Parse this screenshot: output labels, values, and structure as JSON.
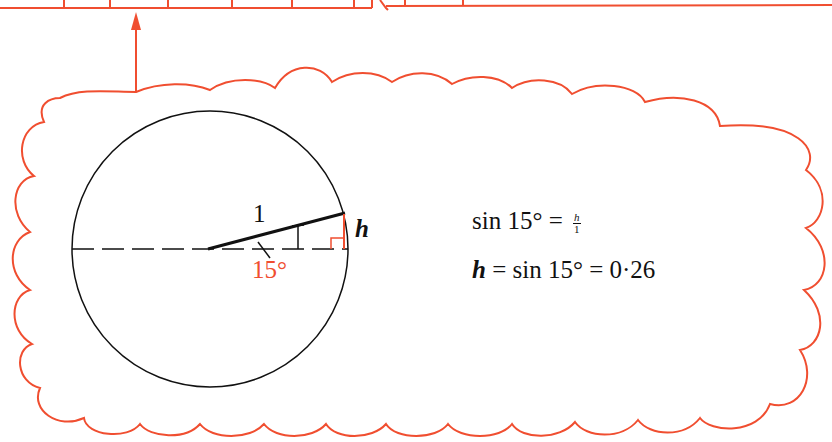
{
  "diagram": {
    "colors": {
      "accent": "#f04e30",
      "ink": "#111111"
    },
    "labels": {
      "radius": "1",
      "opposite": "h",
      "angle": "15°"
    },
    "equations": {
      "line1_lhs": "sin 15° = ",
      "line1_frac_num": "h",
      "line1_frac_den": "1",
      "line2_var": "h",
      "line2_rest": " = sin 15° = 0·26"
    }
  }
}
